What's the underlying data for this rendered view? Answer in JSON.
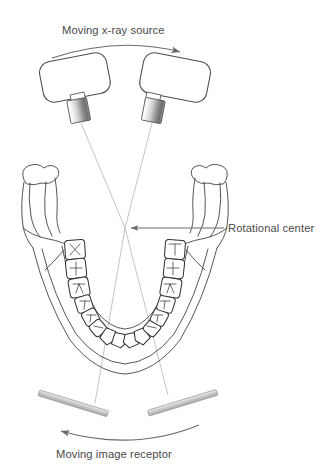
{
  "figure": {
    "title_top": "Moving x-ray source",
    "label_rotational_center": "Rotational center",
    "title_bottom": "Moving image receptor",
    "background_color": "#ffffff",
    "line_color": "#3d3d3d",
    "faint_line_color": "#b9b9b9",
    "text_color": "#4a4a4a",
    "receptor_color": "#c9c9c9"
  },
  "annotations": {
    "top_arrow": {
      "name": "moving-x-ray-source-arrow",
      "direction": "clockwise-right",
      "description": "curved arrow above the two x-ray tube heads pointing to the right"
    },
    "bottom_arrow": {
      "name": "moving-image-receptor-arrow",
      "direction": "counterclockwise-left",
      "description": "curved arrow below the two image receptors pointing to the left"
    },
    "pointer_line": {
      "name": "rotational-center-pointer",
      "direction": "left",
      "description": "straight leader line with left arrowhead from the label to the beam crossing point"
    }
  },
  "xray_sources": [
    {
      "id": "left",
      "label": "x-ray tube head (left position)",
      "tilt_degrees": -12,
      "collimator": "cylindrical"
    },
    {
      "id": "right",
      "label": "x-ray tube head (right position)",
      "tilt_degrees": 12,
      "collimator": "cylindrical"
    }
  ],
  "receptors": [
    {
      "id": "left",
      "label": "image receptor (left position)",
      "tilt_degrees": 18
    },
    {
      "id": "right",
      "label": "image receptor (right position)",
      "tilt_degrees": -18
    }
  ],
  "anatomy": {
    "structure": "mandible",
    "view": "occlusal / superior",
    "parts": [
      "left condyle",
      "left ramus",
      "left body",
      "dental arch",
      "right body",
      "right ramus",
      "right condyle"
    ],
    "teeth_count": 16
  },
  "beams": {
    "count": 2,
    "crossing_point": {
      "x": 125,
      "y": 228
    },
    "description": "two x-ray beams from the opposing tube head positions cross at the rotational center and continue to the opposing image receptors"
  },
  "tooth_marks": [
    "✕",
    "✛",
    "⑂",
    "⑁",
    "⑂",
    "⑁",
    "⑂",
    "⑁",
    "⑂",
    "⑁"
  ]
}
